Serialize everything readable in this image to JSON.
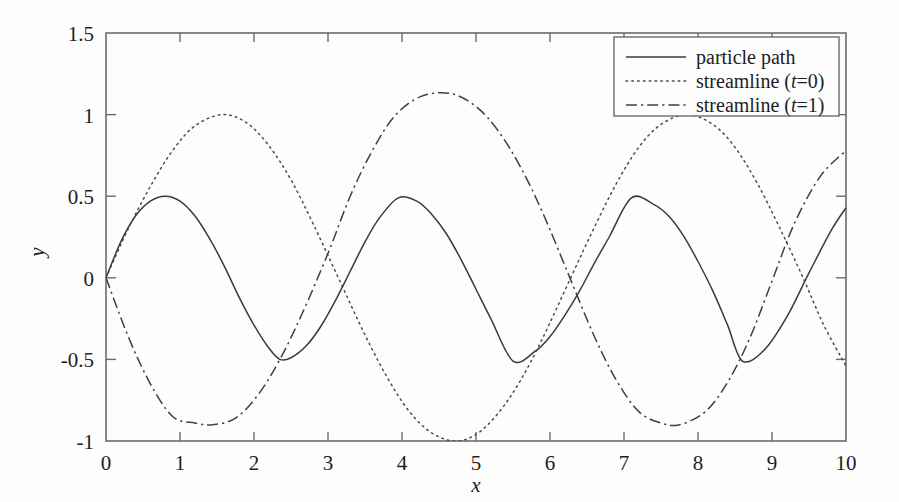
{
  "chart_data": {
    "type": "line",
    "title": "",
    "xlabel": "x",
    "ylabel": "y",
    "xlim": [
      0,
      10
    ],
    "ylim": [
      -1,
      1.5
    ],
    "grid": false,
    "legend_position": "top-right",
    "xticks": [
      "0",
      "1",
      "2",
      "3",
      "4",
      "5",
      "6",
      "7",
      "8",
      "9",
      "10"
    ],
    "xtick_values": [
      0,
      1,
      2,
      3,
      4,
      5,
      6,
      7,
      8,
      9,
      10
    ],
    "yticks": [
      "1.5",
      "1",
      "0.5",
      "0",
      "-0.5",
      "-1"
    ],
    "ytick_values": [
      1.5,
      1,
      0.5,
      0,
      -0.5,
      -1
    ],
    "series": [
      {
        "name": "particle path",
        "style": "solid",
        "color": "#3a3a3a",
        "amplitude": 0.5,
        "x": [
          0,
          0.2,
          0.4,
          0.6,
          0.8,
          1.0,
          1.2,
          1.4,
          1.6,
          1.8,
          2.0,
          2.2,
          2.35,
          2.5,
          2.7,
          2.9,
          3.1,
          3.3,
          3.5,
          3.7,
          3.95,
          4.2,
          4.4,
          4.6,
          4.8,
          5.0,
          5.2,
          5.5,
          5.8,
          6.0,
          6.2,
          6.4,
          6.6,
          6.8,
          7.1,
          7.4,
          7.6,
          7.8,
          8.0,
          8.2,
          8.4,
          8.6,
          8.9,
          9.2,
          9.5,
          9.8,
          10.0
        ],
        "y": [
          0,
          0.22,
          0.38,
          0.47,
          0.5,
          0.47,
          0.38,
          0.24,
          0.07,
          -0.12,
          -0.29,
          -0.43,
          -0.5,
          -0.49,
          -0.42,
          -0.3,
          -0.14,
          0.04,
          0.22,
          0.37,
          0.49,
          0.47,
          0.39,
          0.27,
          0.11,
          -0.07,
          -0.25,
          -0.51,
          -0.45,
          -0.36,
          -0.23,
          -0.08,
          0.09,
          0.25,
          0.49,
          0.45,
          0.38,
          0.26,
          0.1,
          -0.08,
          -0.29,
          -0.51,
          -0.44,
          -0.24,
          0.03,
          0.29,
          0.43
        ]
      },
      {
        "name": "streamline (t=0)",
        "style": "dotted",
        "color": "#4a4a4a",
        "amplitude": 1.0,
        "x": [
          0,
          0.3,
          0.6,
          0.9,
          1.2,
          1.57,
          1.9,
          2.2,
          2.5,
          2.8,
          3.14,
          3.5,
          3.8,
          4.1,
          4.4,
          4.71,
          5.0,
          5.3,
          5.6,
          5.9,
          6.28,
          6.6,
          6.9,
          7.2,
          7.5,
          7.85,
          8.2,
          8.5,
          8.8,
          9.1,
          9.42,
          9.7,
          10.0
        ],
        "y": [
          0,
          0.3,
          0.56,
          0.78,
          0.93,
          1.0,
          0.95,
          0.81,
          0.6,
          0.33,
          0.0,
          -0.35,
          -0.61,
          -0.82,
          -0.95,
          -1.0,
          -0.96,
          -0.83,
          -0.63,
          -0.37,
          0.0,
          0.31,
          0.58,
          0.8,
          0.94,
          1.0,
          0.94,
          0.8,
          0.58,
          0.31,
          0.0,
          -0.29,
          -0.54
        ]
      },
      {
        "name": "streamline (t=1)",
        "style": "dashdot",
        "color": "#3f3f3f",
        "amplitude": 1.13,
        "x": [
          0,
          0.3,
          0.6,
          0.9,
          1.2,
          1.45,
          1.75,
          2.05,
          2.35,
          2.65,
          3.0,
          3.3,
          3.6,
          3.9,
          4.25,
          4.65,
          5.0,
          5.3,
          5.6,
          5.9,
          6.25,
          6.6,
          6.9,
          7.2,
          7.5,
          7.75,
          8.1,
          8.4,
          8.7,
          9.0,
          9.3,
          9.65,
          10.0
        ],
        "y": [
          0,
          -0.36,
          -0.65,
          -0.85,
          -0.89,
          -0.9,
          -0.86,
          -0.72,
          -0.5,
          -0.22,
          0.15,
          0.5,
          0.78,
          0.99,
          1.11,
          1.13,
          1.05,
          0.9,
          0.68,
          0.4,
          0.02,
          -0.36,
          -0.63,
          -0.82,
          -0.89,
          -0.9,
          -0.82,
          -0.64,
          -0.37,
          -0.02,
          0.33,
          0.62,
          0.78
        ]
      }
    ],
    "legend": [
      {
        "label_prefix": "particle path",
        "label_suffix": "",
        "has_italic_t": false,
        "style": "solid"
      },
      {
        "label_prefix": "streamline (",
        "italic": "t",
        "label_suffix": "=0)",
        "has_italic_t": true,
        "style": "dotted"
      },
      {
        "label_prefix": "streamline (",
        "italic": "t",
        "label_suffix": "=1)",
        "has_italic_t": true,
        "style": "dashdot"
      }
    ]
  },
  "axes": {
    "x_title": "x",
    "y_title": "y"
  },
  "colors": {
    "frame": "#6b6b6b",
    "text": "#1d1d1d",
    "background": "#fdfdfd"
  }
}
